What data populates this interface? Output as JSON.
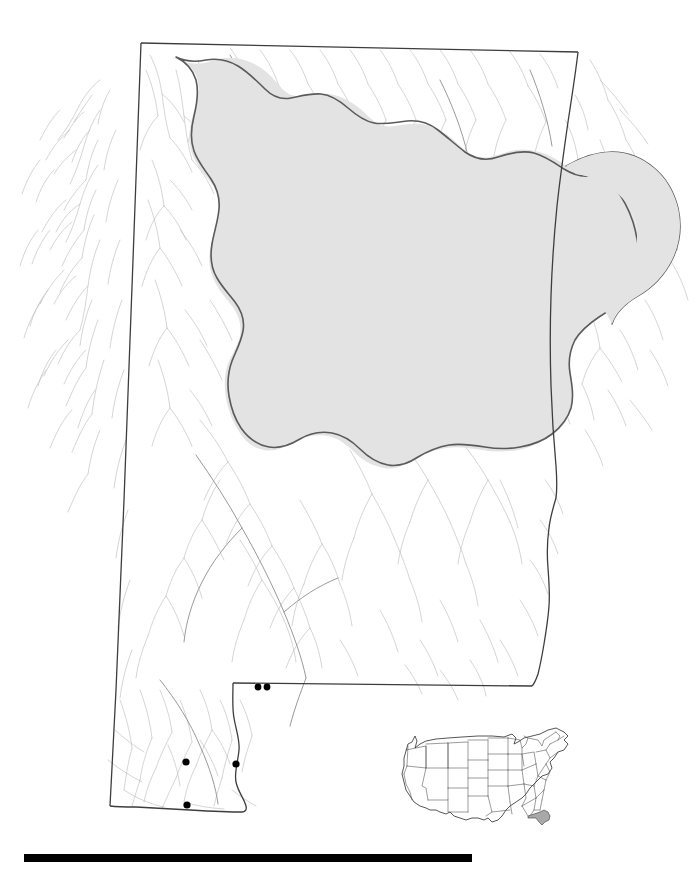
{
  "figure": {
    "type": "distribution-map",
    "region_label": "Alabama",
    "background_color": "#ffffff"
  },
  "styles": {
    "state_border_color": "#3d3d3d",
    "state_border_width": 1.2,
    "state_fill": "#ffffff",
    "watershed_outline_color": "#5a5a5a",
    "watershed_outline_width": 1.6,
    "watershed_fill": "#e3e3e3",
    "stream_color": "#b9b9b9",
    "stream_major_color": "#9a9a9a",
    "stream_width": 0.55,
    "stream_major_width": 0.9,
    "occurrence_dot_color": "#000000",
    "occurrence_dot_radius": 3.4,
    "inset_border_color": "#2b2b2b",
    "inset_state_line_color": "#4a4a4a",
    "inset_highlight_fill": "#a8a8a8",
    "scalebar_color": "#000000"
  },
  "scalebar": {
    "x": 24,
    "y": 854,
    "width": 448,
    "height": 8,
    "label": ""
  },
  "inset": {
    "name": "united-states-locator",
    "x": 392,
    "y": 722,
    "width": 190,
    "height": 112,
    "highlighted_state": "Florida",
    "highlight_fill": "#a8a8a8"
  },
  "occurrences": {
    "count": 5,
    "points": [
      {
        "id": "pt-1",
        "x": 258,
        "y": 687
      },
      {
        "id": "pt-2",
        "x": 267,
        "y": 687
      },
      {
        "id": "pt-3",
        "x": 186,
        "y": 762
      },
      {
        "id": "pt-4",
        "x": 236,
        "y": 764
      },
      {
        "id": "pt-5",
        "x": 187,
        "y": 805
      }
    ]
  },
  "chart_data": {
    "type": "map",
    "title": "",
    "xlabel": "",
    "ylabel": "",
    "layers": [
      {
        "name": "hydrography",
        "style": "thin gray lines",
        "color": "#b9b9b9"
      },
      {
        "name": "state-boundary",
        "style": "solid dark line",
        "color": "#3d3d3d"
      },
      {
        "name": "highlighted-watershed",
        "style": "gray fill with dark outline",
        "color": "#e3e3e3"
      },
      {
        "name": "occurrence-points",
        "style": "filled black circles",
        "color": "#000000",
        "count": 5
      },
      {
        "name": "us-locator-inset",
        "style": "line map, Florida filled gray",
        "color": "#a8a8a8"
      },
      {
        "name": "scale-bar",
        "style": "solid black bar",
        "color": "#000000"
      }
    ]
  }
}
